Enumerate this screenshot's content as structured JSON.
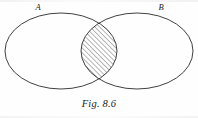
{
  "figure": {
    "caption": "Fig. 8.6",
    "background_color": "#fefefe",
    "stroke_color": "#2b2b2b",
    "hatch_color": "#555555",
    "labels": {
      "left_set": "A",
      "right_set": "B"
    }
  },
  "diagram": {
    "type": "venn-two-set",
    "shaded_region": "intersection",
    "hatch_direction": "diagonal-up-right",
    "left_ellipse": {
      "name": "A",
      "cx": 61,
      "cy": 51,
      "rx": 56,
      "ry": 38
    },
    "right_ellipse": {
      "name": "B",
      "cx": 137,
      "cy": 51,
      "rx": 56,
      "ry": 38
    },
    "label_positions": {
      "left_set": {
        "x": 38,
        "y": 10
      },
      "right_set": {
        "x": 161,
        "y": 10
      }
    }
  }
}
